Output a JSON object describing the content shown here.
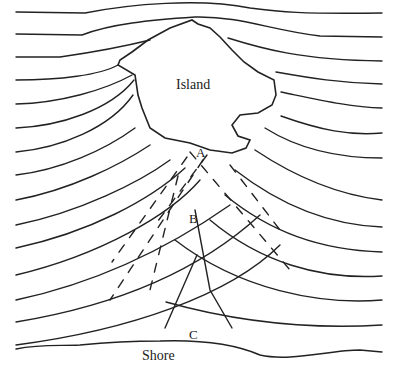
{
  "labels": {
    "island": "Island",
    "shore": "Shore",
    "point_a": "A",
    "point_b": "B",
    "point_c": "C"
  },
  "colors": {
    "line": "#222222",
    "background": "#ffffff"
  }
}
